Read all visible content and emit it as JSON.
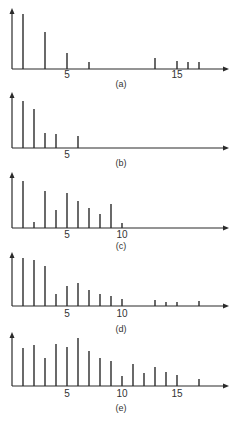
{
  "figure": {
    "colors": {
      "ink": "#2a2a2a",
      "background": "#ffffff",
      "label": "#333333"
    }
  },
  "chart_data": [
    {
      "type": "bar",
      "style": "stem",
      "caption": "(a)",
      "x": [
        1,
        3,
        5,
        7,
        13,
        15,
        16,
        17
      ],
      "values": [
        55,
        37,
        16,
        7,
        11,
        8,
        7,
        7
      ],
      "xticks": [
        5,
        15
      ],
      "xlim": [
        0,
        19
      ],
      "ylim": [
        0,
        60
      ],
      "xlabel": "",
      "ylabel": "",
      "grid": false
    },
    {
      "type": "bar",
      "style": "stem",
      "caption": "(b)",
      "x": [
        1,
        2,
        3,
        4,
        6
      ],
      "values": [
        47,
        39,
        15,
        14,
        12
      ],
      "xticks": [
        5
      ],
      "xlim": [
        0,
        19
      ],
      "ylim": [
        0,
        60
      ],
      "xlabel": "",
      "ylabel": "",
      "grid": false
    },
    {
      "type": "bar",
      "style": "stem",
      "caption": "(c)",
      "x": [
        1,
        2,
        3,
        4,
        5,
        6,
        7,
        8,
        9,
        10
      ],
      "values": [
        47,
        6,
        37,
        18,
        35,
        27,
        20,
        14,
        24,
        5
      ],
      "xticks": [
        5,
        10
      ],
      "xlim": [
        0,
        19
      ],
      "ylim": [
        0,
        60
      ],
      "xlabel": "",
      "ylabel": "",
      "grid": false
    },
    {
      "type": "bar",
      "style": "stem",
      "caption": "(d)",
      "x": [
        1,
        2,
        3,
        4,
        5,
        6,
        7,
        8,
        9,
        10,
        13,
        14,
        15,
        17
      ],
      "values": [
        48,
        46,
        40,
        12,
        20,
        23,
        16,
        12,
        10,
        7,
        6,
        4,
        4,
        5
      ],
      "xticks": [
        5,
        10
      ],
      "xlim": [
        0,
        19
      ],
      "ylim": [
        0,
        60
      ],
      "xlabel": "",
      "ylabel": "",
      "grid": false
    },
    {
      "type": "bar",
      "style": "stem",
      "caption": "(e)",
      "x": [
        1,
        2,
        3,
        4,
        5,
        6,
        7,
        8,
        9,
        10,
        11,
        12,
        13,
        14,
        15,
        17
      ],
      "values": [
        38,
        41,
        28,
        42,
        39,
        48,
        35,
        28,
        25,
        10,
        22,
        13,
        19,
        14,
        11,
        7
      ],
      "xticks": [
        5,
        10,
        15
      ],
      "xlim": [
        0,
        19
      ],
      "ylim": [
        0,
        60
      ],
      "xlabel": "",
      "ylabel": "",
      "grid": false
    }
  ]
}
